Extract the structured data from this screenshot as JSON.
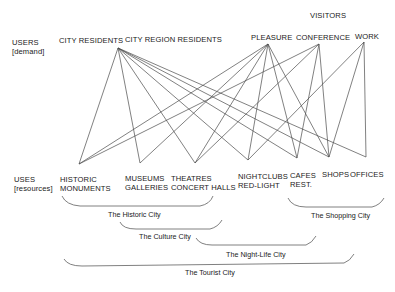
{
  "diagram": {
    "visitors_heading": "VISITORS",
    "users_row": {
      "label_line1": "USERS",
      "label_line2": "[demand]",
      "nodes": [
        {
          "id": "city_residents",
          "label": "CITY RESIDENTS"
        },
        {
          "id": "city_region_residents",
          "label": "CITY REGION RESIDENTS"
        },
        {
          "id": "pleasure",
          "label": "PLEASURE"
        },
        {
          "id": "conference",
          "label": "CONFERENCE"
        },
        {
          "id": "work",
          "label": "WORK"
        }
      ]
    },
    "uses_row": {
      "label_line1": "USES",
      "label_line2": "[resources]",
      "nodes": [
        {
          "id": "historic",
          "line1": "HISTORIC",
          "line2": "MONUMENTS"
        },
        {
          "id": "museums",
          "line1": "MUSEUMS",
          "line2": "GALLERIES"
        },
        {
          "id": "theatres",
          "line1": "THEATRES",
          "line2": "CONCERT HALLS"
        },
        {
          "id": "nightclubs",
          "line1": "NIGHTCLUBS",
          "line2": "RED-LIGHT"
        },
        {
          "id": "cafes",
          "line1": "CAFES",
          "line2": "REST."
        },
        {
          "id": "shops",
          "line1": "SHOPS",
          "line2": ""
        },
        {
          "id": "offices",
          "line1": "OFFICES",
          "line2": ""
        }
      ]
    },
    "edges": [
      {
        "from": "city",
        "to": "historic"
      },
      {
        "from": "city",
        "to": "museums"
      },
      {
        "from": "city",
        "to": "theatres"
      },
      {
        "from": "city",
        "to": "nightclubs"
      },
      {
        "from": "city",
        "to": "cafes"
      },
      {
        "from": "city",
        "to": "shops"
      },
      {
        "from": "city",
        "to": "offices"
      },
      {
        "from": "pleasure",
        "to": "historic"
      },
      {
        "from": "pleasure",
        "to": "museums"
      },
      {
        "from": "pleasure",
        "to": "theatres"
      },
      {
        "from": "pleasure",
        "to": "nightclubs"
      },
      {
        "from": "pleasure",
        "to": "cafes"
      },
      {
        "from": "pleasure",
        "to": "shops"
      },
      {
        "from": "conference",
        "to": "historic"
      },
      {
        "from": "conference",
        "to": "theatres"
      },
      {
        "from": "conference",
        "to": "cafes"
      },
      {
        "from": "conference",
        "to": "shops"
      },
      {
        "from": "work",
        "to": "nightclubs"
      },
      {
        "from": "work",
        "to": "shops"
      },
      {
        "from": "work",
        "to": "offices"
      }
    ],
    "groupings": [
      {
        "label": "The Historic City",
        "spans": [
          "historic",
          "museums",
          "theatres"
        ]
      },
      {
        "label": "The Shopping City",
        "spans": [
          "cafes",
          "shops",
          "offices"
        ]
      },
      {
        "label": "The Culture City",
        "spans": [
          "museums",
          "theatres"
        ]
      },
      {
        "label": "The Night-Life City",
        "spans": [
          "theatres",
          "nightclubs",
          "cafes"
        ]
      },
      {
        "label": "The Tourist City",
        "spans": [
          "historic",
          "museums",
          "theatres",
          "nightclubs",
          "cafes",
          "shops"
        ]
      }
    ]
  }
}
